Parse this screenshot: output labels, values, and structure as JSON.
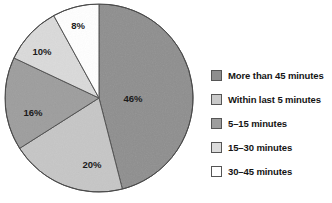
{
  "chart_data": {
    "type": "pie",
    "title": "",
    "subtitle": "",
    "xlabel": "",
    "ylabel": "",
    "legend_position": "right",
    "grid": false,
    "start_angle_deg": 0,
    "direction": "clockwise",
    "categories": [
      "More than 45 minutes",
      "Within last 5 minutes",
      "5–15 minutes",
      "15–30 minutes",
      "30–45 minutes"
    ],
    "values": [
      46,
      20,
      16,
      10,
      8
    ],
    "value_unit": "%",
    "slices": [
      {
        "label": "More than 45 minutes",
        "value": 46,
        "display": "46%",
        "color": "#8e8e8e",
        "label_x": 133,
        "label_y": 99
      },
      {
        "label": "Within last 5 minutes",
        "value": 20,
        "display": "20%",
        "color": "#c6c6c6",
        "label_x": 92,
        "label_y": 165
      },
      {
        "label": "5–15 minutes",
        "value": 16,
        "display": "16%",
        "color": "#9d9d9d",
        "label_x": 33,
        "label_y": 113
      },
      {
        "label": "15–30 minutes",
        "value": 10,
        "display": "10%",
        "color": "#dadada",
        "label_x": 42,
        "label_y": 52
      },
      {
        "label": "30–45 minutes",
        "value": 8,
        "display": "8%",
        "color": "#ffffff",
        "label_x": 78,
        "label_y": 26
      }
    ],
    "geometry": {
      "center_x": 99,
      "center_y": 98,
      "radius": 94
    },
    "style": {
      "outline_color": "#4a4a4a",
      "outline_width": 1,
      "label_color": "#1b1b1b",
      "background": "#ffffff"
    }
  },
  "legend": {
    "items": [
      {
        "label": "More than 45 minutes",
        "color": "#8e8e8e"
      },
      {
        "label": "Within last 5 minutes",
        "color": "#c9c9c9"
      },
      {
        "label": "5–15 minutes",
        "color": "#9d9d9d"
      },
      {
        "label": "15–30 minutes",
        "color": "#dcdcdc"
      },
      {
        "label": "30–45 minutes",
        "color": "#ffffff"
      }
    ]
  }
}
